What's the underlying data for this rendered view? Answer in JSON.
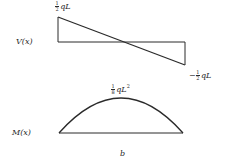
{
  "shear_diagram": {
    "axis_label": "V(x)",
    "max_label": {
      "sign": "",
      "num": "1",
      "den": "2",
      "expr": "qL"
    },
    "min_label": {
      "sign": "−",
      "num": "1",
      "den": "2",
      "expr": "qL"
    }
  },
  "moment_diagram": {
    "axis_label": "M(x)",
    "peak_label": {
      "num": "1",
      "den": "8",
      "expr": "qL",
      "exp": "2"
    },
    "caption": "b"
  },
  "colors": {
    "line": "#2a2a2a",
    "background": "#ffffff"
  }
}
